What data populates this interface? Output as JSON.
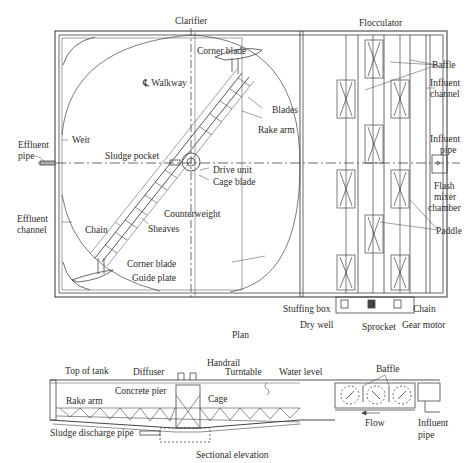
{
  "figure": {
    "plan_caption": "Plan",
    "elevation_caption": "Sectional elevation"
  },
  "plan": {
    "sections": {
      "clarifier": "Clarifier",
      "flocculator": "Flocculator"
    },
    "labels": {
      "corner_blade_top": "Corner blade",
      "walkway": "℄ Walkway",
      "blades": "Blades",
      "rake_arm": "Rake arm",
      "effluent_pipe_1": "Effluent",
      "effluent_pipe_2": "pipe",
      "weir": "Weir",
      "sludge_pocket": "Sludge pocket",
      "drive_unit": "Drive unit",
      "cage_blade": "Cage blade",
      "effluent_channel_1": "Effluent",
      "effluent_channel_2": "channel",
      "counterweight": "Counterweight",
      "chain_left": "Chain",
      "sheaves": "Sheaves",
      "corner_blade_bottom": "Corner blade",
      "guide_plate": "Guide plate",
      "baffle": "Baffle",
      "influent_channel_1": "Influent",
      "influent_channel_2": "channel",
      "influent_pipe_1": "Influent",
      "influent_pipe_2": "pipe",
      "flash_mixer_1": "Flash",
      "flash_mixer_2": "mixer",
      "flash_mixer_3": "chamber",
      "paddle": "Paddle",
      "stuffing_box": "Stuffing box",
      "chain_right": "Chain",
      "dry_well": "Dry well",
      "sprocket": "Sprocket",
      "gear_motor": "Gear motor"
    }
  },
  "elevation": {
    "labels": {
      "top_of_tank": "Top of tank",
      "diffuser": "Diffuser",
      "handrail": "Handrail",
      "turntable": "Turntable",
      "water_level": "Water level",
      "baffle": "Baffle",
      "concrete_pier": "Concrete pier",
      "cage": "Cage",
      "rake_arm": "Rake arm",
      "sludge_discharge_pipe": "Sludge discharge pipe",
      "flow": "Flow",
      "influent_pipe_1": "Influent",
      "influent_pipe_2": "pipe"
    }
  },
  "colors": {
    "ink": "#3a3a3a",
    "paper": "#ffffff"
  }
}
